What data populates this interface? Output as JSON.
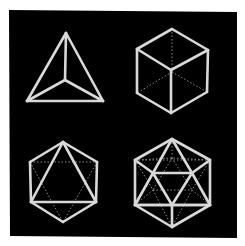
{
  "figure": {
    "title": "Platonic solids wireframes",
    "background_color": "#ffffff",
    "panel_color": "#000000",
    "line_color": "#d9d9d9",
    "hidden_line_color": "#8a8a8a"
  },
  "solids": [
    {
      "name": "Tetrahedron",
      "position": "top-left",
      "vertices": {
        "apex": [
          66,
          33
        ],
        "bl": [
          27,
          101
        ],
        "br": [
          103,
          101
        ],
        "c": [
          65,
          80
        ]
      },
      "solid_edges": [
        [
          "apex",
          "bl"
        ],
        [
          "bl",
          "br"
        ],
        [
          "br",
          "apex"
        ],
        [
          "apex",
          "c"
        ],
        [
          "c",
          "bl"
        ],
        [
          "c",
          "br"
        ]
      ],
      "hidden_edges": []
    },
    {
      "name": "Cube",
      "position": "top-right",
      "vertices": {
        "t": [
          172,
          29
        ],
        "ul": [
          137,
          49
        ],
        "ur": [
          208,
          50
        ],
        "c": [
          171,
          70
        ],
        "ll": [
          137,
          93
        ],
        "lr": [
          207,
          92
        ],
        "b": [
          171,
          113
        ],
        "h": [
          172,
          72
        ]
      },
      "solid_edges": [
        [
          "t",
          "ul"
        ],
        [
          "t",
          "ur"
        ],
        [
          "ul",
          "c"
        ],
        [
          "ur",
          "c"
        ],
        [
          "ul",
          "ll"
        ],
        [
          "ur",
          "lr"
        ],
        [
          "c",
          "b"
        ],
        [
          "ll",
          "b"
        ],
        [
          "lr",
          "b"
        ]
      ],
      "hidden_edges": [
        [
          "h",
          "t"
        ],
        [
          "h",
          "ll"
        ],
        [
          "h",
          "lr"
        ]
      ]
    },
    {
      "name": "Octahedron",
      "position": "bottom-left",
      "vertices": {
        "t": [
          63,
          142
        ],
        "ul": [
          30,
          162
        ],
        "ur": [
          97,
          162
        ],
        "ll": [
          31,
          202
        ],
        "lr": [
          96,
          202
        ],
        "b": [
          63,
          222
        ]
      },
      "solid_edges": [
        [
          "t",
          "ul"
        ],
        [
          "t",
          "ur"
        ],
        [
          "ul",
          "ll"
        ],
        [
          "ur",
          "lr"
        ],
        [
          "ll",
          "b"
        ],
        [
          "lr",
          "b"
        ],
        [
          "t",
          "ll"
        ],
        [
          "t",
          "lr"
        ],
        [
          "ll",
          "lr"
        ]
      ],
      "hidden_edges": [
        [
          "ul",
          "ur"
        ],
        [
          "ul",
          "b"
        ],
        [
          "ur",
          "b"
        ]
      ]
    },
    {
      "name": "Icosahedron",
      "position": "bottom-right",
      "vertices": {
        "t": [
          172,
          139
        ],
        "ul": [
          135,
          160
        ],
        "ur": [
          210,
          160
        ],
        "ll": [
          135,
          205
        ],
        "lr": [
          210,
          205
        ],
        "b": [
          172,
          227
        ],
        "il": [
          153,
          173
        ],
        "ir": [
          192,
          173
        ],
        "ib": [
          172,
          205
        ],
        "hl": [
          153,
          190
        ],
        "hr": [
          192,
          190
        ],
        "ht": [
          172,
          158
        ]
      },
      "solid_edges": [
        [
          "t",
          "ul"
        ],
        [
          "t",
          "ur"
        ],
        [
          "ul",
          "ll"
        ],
        [
          "ur",
          "lr"
        ],
        [
          "ll",
          "b"
        ],
        [
          "lr",
          "b"
        ],
        [
          "t",
          "il"
        ],
        [
          "t",
          "ir"
        ],
        [
          "il",
          "ir"
        ],
        [
          "il",
          "ib"
        ],
        [
          "ir",
          "ib"
        ],
        [
          "ul",
          "il"
        ],
        [
          "ur",
          "ir"
        ],
        [
          "il",
          "ll"
        ],
        [
          "ir",
          "lr"
        ],
        [
          "ib",
          "ll"
        ],
        [
          "ib",
          "lr"
        ],
        [
          "ib",
          "b"
        ],
        [
          "ll",
          "lr"
        ]
      ],
      "hidden_edges": [
        [
          "ul",
          "ur"
        ],
        [
          "ul",
          "hl"
        ],
        [
          "ur",
          "hr"
        ],
        [
          "hl",
          "hr"
        ],
        [
          "ht",
          "hl"
        ],
        [
          "ht",
          "hr"
        ],
        [
          "ul",
          "ht"
        ],
        [
          "ur",
          "ht"
        ],
        [
          "hl",
          "b"
        ],
        [
          "hr",
          "b"
        ],
        [
          "hl",
          "ll"
        ],
        [
          "hr",
          "lr"
        ],
        [
          "t",
          "ht"
        ]
      ]
    }
  ]
}
